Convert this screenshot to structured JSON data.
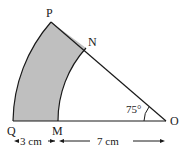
{
  "diagram": {
    "type": "annular-sector",
    "points": {
      "P": "P",
      "N": "N",
      "Q": "Q",
      "M": "M",
      "O": "O"
    },
    "angle_label": "75°",
    "dimensions": {
      "QM": "3 cm",
      "MO": "7 cm"
    },
    "colors": {
      "shaded_region": "#bfbfbf",
      "stroke": "#1a1a1a",
      "background": "#ffffff"
    }
  }
}
